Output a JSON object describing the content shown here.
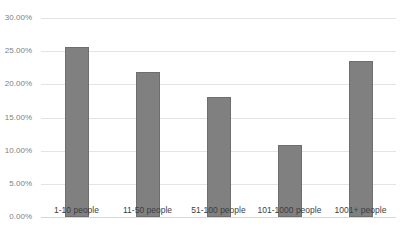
{
  "chart_data": {
    "type": "bar",
    "title": "",
    "xlabel": "",
    "ylabel": "",
    "categories": [
      "1-10 people",
      "11-50 people",
      "51-100 people",
      "101-1000 people",
      "1001+ people"
    ],
    "values": [
      25.6,
      21.8,
      18.1,
      10.8,
      23.5
    ],
    "value_labels": [
      "25.60%",
      "21.80%",
      "18.10%",
      "10.80%",
      "23.50%"
    ],
    "ylim": [
      0,
      30
    ],
    "ytick_values": [
      0,
      5,
      10,
      15,
      20,
      25,
      30
    ],
    "ytick_labels": [
      "0.00%",
      "5.00%",
      "10.00%",
      "15.00%",
      "20.00%",
      "25.00%",
      "30.00%"
    ],
    "grid": true,
    "legend": false,
    "legend_position": "none",
    "series": [
      {
        "name": "",
        "values": [
          25.6,
          21.8,
          18.1,
          10.8,
          23.5
        ]
      }
    ]
  },
  "style": {
    "bar_color": "#808080",
    "bar_border_color": "#6e6e6e",
    "gridline_color": "#e4e4e6",
    "baseline_color": "#d6d6d8",
    "ytick_label_color": "#808080",
    "xtick_label_color": "#3d3d3d",
    "background_color": "#ffffff"
  },
  "title_remnant": {
    "text": ""
  }
}
